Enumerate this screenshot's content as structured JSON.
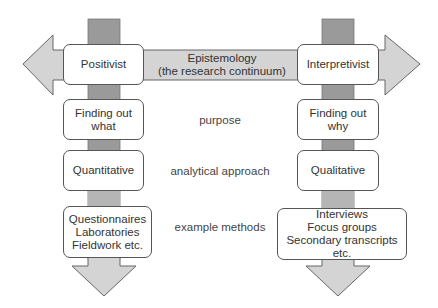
{
  "colors": {
    "vertical_bar": "#9a9a9a",
    "arrow_fill": "#d4d4d4",
    "arrow_stroke": "#666666",
    "box_border": "#555555",
    "text": "#333333"
  },
  "continuum": {
    "line1": "Epistemology",
    "line2": "(the research continuum)"
  },
  "left_column": {
    "heading": "Positivist",
    "purpose": [
      "Finding out",
      "what"
    ],
    "approach": "Quantitative",
    "methods": [
      "Questionnaires",
      "Laboratories",
      "Fieldwork etc."
    ]
  },
  "right_column": {
    "heading": "Interpretivist",
    "purpose": [
      "Finding out",
      "why"
    ],
    "approach": "Qualitative",
    "methods": [
      "Interviews",
      "Focus groups",
      "Secondary transcripts etc."
    ]
  },
  "row_labels": {
    "purpose": "purpose",
    "approach": "analytical approach",
    "methods": "example methods"
  }
}
